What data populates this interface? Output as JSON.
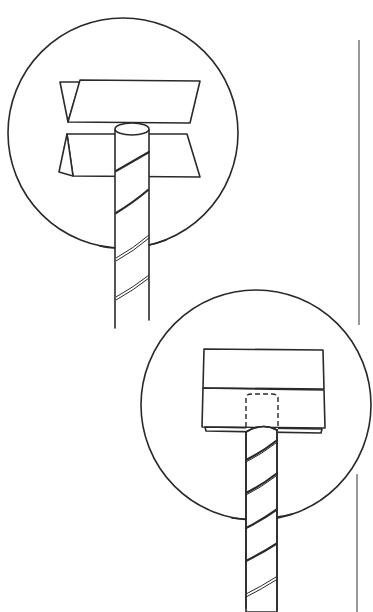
{
  "figure": {
    "colors": {
      "ink": "#2a2a2a",
      "background": "#ffffff",
      "margin_line": "#555555"
    },
    "panels": [
      {
        "id": "step-1",
        "label": "",
        "content": "rod placed between two separated angled jaw plates, inside circular detail view"
      },
      {
        "id": "step-2",
        "label": "",
        "content": "rod inserted into closed block, hidden end shown with dashed line, inside circular detail view"
      }
    ]
  }
}
